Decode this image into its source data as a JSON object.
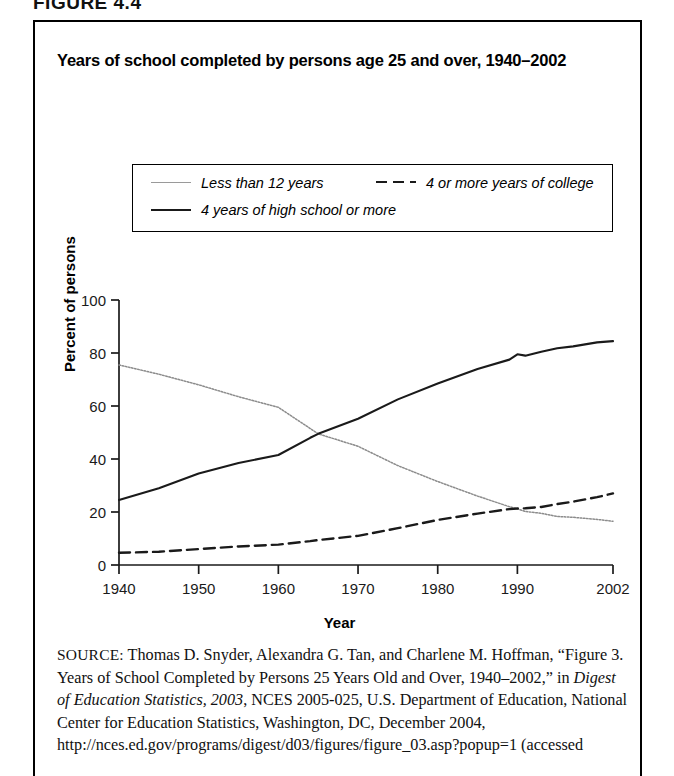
{
  "figure_label": "FIGURE 4.4",
  "chart_title": "Years of school completed by persons age 25 and over, 1940–2002",
  "legend": {
    "items": [
      {
        "label": "Less than 12 years",
        "style": "dotted"
      },
      {
        "label": "4 or more years of college",
        "style": "dashed"
      },
      {
        "label": "4 years of high school or more",
        "style": "solid"
      }
    ]
  },
  "axes": {
    "xlabel": "Year",
    "ylabel": "Percent of persons",
    "xticks": [
      "1940",
      "1950",
      "1960",
      "1970",
      "1980",
      "1990",
      "2002"
    ],
    "yticks": [
      "0",
      "20",
      "40",
      "60",
      "80",
      "100"
    ]
  },
  "source": {
    "prefix": "SOURCE:",
    "text_1": " Thomas D. Snyder, Alexandra G. Tan, and Charlene M. Hoffman, “Figure 3. Years of School Completed by Persons 25 Years Old and Over, 1940–2002,” in ",
    "italic_1": "Digest of Education Statistics, 2003",
    "text_2": ", NCES 2005-025, U.S. Department of Education, National Center for Education Statistics, Washington, DC, December 2004, http://nces.ed.gov/programs/digest/d03/figures/figure_03.asp?popup=1 (accessed"
  },
  "chart_data": {
    "type": "line",
    "title": "Years of school completed by persons age 25 and over, 1940–2002",
    "xlabel": "Year",
    "ylabel": "Percent of persons",
    "xlim": [
      1940,
      2002
    ],
    "ylim": [
      0,
      100
    ],
    "xticks": [
      1940,
      1950,
      1960,
      1970,
      1980,
      1990,
      2002
    ],
    "yticks": [
      0,
      20,
      40,
      60,
      80,
      100
    ],
    "grid": false,
    "legend_position": "above-plot",
    "series": [
      {
        "name": "Less than 12 years",
        "style": "dotted",
        "color": "#8c8c8c",
        "x": [
          1940,
          1945,
          1950,
          1955,
          1960,
          1964,
          1965,
          1970,
          1975,
          1980,
          1985,
          1989,
          1990,
          1991,
          1993,
          1995,
          1997,
          2000,
          2002
        ],
        "y": [
          75.5,
          72.0,
          68.0,
          63.5,
          59.5,
          51.5,
          49.5,
          44.8,
          37.5,
          31.5,
          26.0,
          22.0,
          21.2,
          20.2,
          19.5,
          18.3,
          18.0,
          17.2,
          16.5
        ]
      },
      {
        "name": "4 years of high school or more",
        "style": "solid",
        "color": "#1a1a1a",
        "x": [
          1940,
          1945,
          1950,
          1955,
          1960,
          1964,
          1965,
          1970,
          1975,
          1980,
          1985,
          1989,
          1990,
          1991,
          1993,
          1995,
          1997,
          2000,
          2002
        ],
        "y": [
          24.5,
          29.0,
          34.5,
          38.5,
          41.5,
          48.0,
          49.5,
          55.2,
          62.5,
          68.5,
          74.0,
          77.5,
          79.5,
          79.0,
          80.5,
          81.8,
          82.5,
          84.0,
          84.5
        ]
      },
      {
        "name": "4 or more years of college",
        "style": "dashed",
        "color": "#1a1a1a",
        "x": [
          1940,
          1945,
          1950,
          1955,
          1960,
          1964,
          1965,
          1970,
          1975,
          1980,
          1985,
          1989,
          1990,
          1991,
          1993,
          1995,
          1997,
          2000,
          2002
        ],
        "y": [
          4.6,
          5.0,
          6.0,
          7.0,
          7.7,
          9.0,
          9.4,
          11.0,
          13.9,
          17.0,
          19.4,
          21.1,
          21.3,
          21.4,
          21.9,
          23.0,
          23.9,
          25.6,
          27.0
        ]
      }
    ]
  }
}
